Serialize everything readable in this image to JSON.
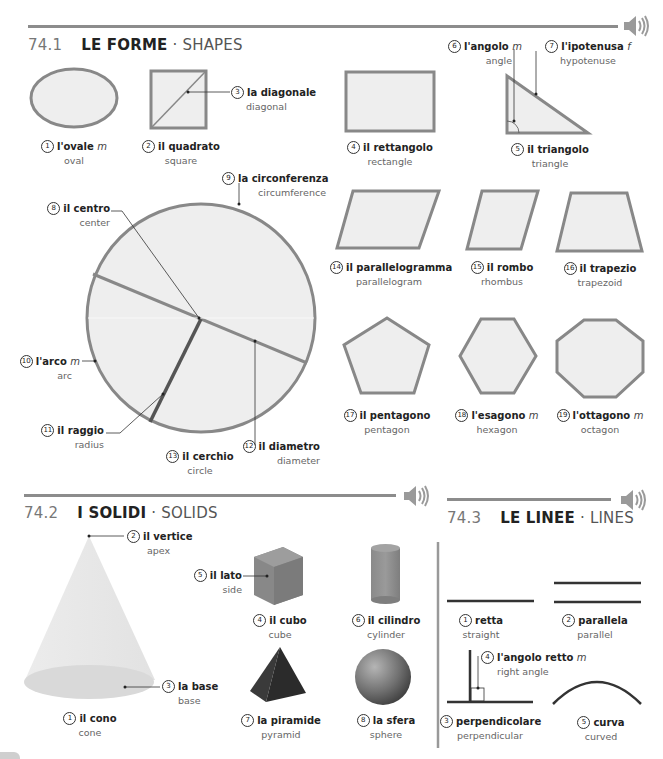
{
  "colors": {
    "shape_fill": "#eeeeee",
    "shape_stroke": "#888888",
    "rule": "#8c8c8c",
    "solid_fill": "#8a8a8a",
    "text_dark": "#222222",
    "text_light": "#666666"
  },
  "sections": {
    "shapes": {
      "number": "74.1",
      "title_it": "LE FORME",
      "separator": "·",
      "title_en": "SHAPES",
      "speaker_icon": "speaker-icon",
      "items": [
        {
          "n": "1",
          "it": "l'ovale",
          "gender": "m",
          "en": "oval"
        },
        {
          "n": "2",
          "it": "il quadrato",
          "gender": "",
          "en": "square"
        },
        {
          "n": "3",
          "it": "la diagonale",
          "gender": "",
          "en": "diagonal"
        },
        {
          "n": "4",
          "it": "il rettangolo",
          "gender": "",
          "en": "rectangle"
        },
        {
          "n": "5",
          "it": "il triangolo",
          "gender": "",
          "en": "triangle"
        },
        {
          "n": "6",
          "it": "l'angolo",
          "gender": "m",
          "en": "angle"
        },
        {
          "n": "7",
          "it": "l'ipotenusa",
          "gender": "f",
          "en": "hypotenuse"
        },
        {
          "n": "8",
          "it": "il centro",
          "gender": "",
          "en": "center"
        },
        {
          "n": "9",
          "it": "la circonferenza",
          "gender": "",
          "en": "circumference"
        },
        {
          "n": "10",
          "it": "l'arco",
          "gender": "m",
          "en": "arc"
        },
        {
          "n": "11",
          "it": "il raggio",
          "gender": "",
          "en": "radius"
        },
        {
          "n": "12",
          "it": "il diametro",
          "gender": "",
          "en": "diameter"
        },
        {
          "n": "13",
          "it": "il cerchio",
          "gender": "",
          "en": "circle"
        },
        {
          "n": "14",
          "it": "il parallelogramma",
          "gender": "",
          "en": "parallelogram"
        },
        {
          "n": "15",
          "it": "il rombo",
          "gender": "",
          "en": "rhombus"
        },
        {
          "n": "16",
          "it": "il trapezio",
          "gender": "",
          "en": "trapezoid"
        },
        {
          "n": "17",
          "it": "il pentagono",
          "gender": "",
          "en": "pentagon"
        },
        {
          "n": "18",
          "it": "l'esagono",
          "gender": "m",
          "en": "hexagon"
        },
        {
          "n": "19",
          "it": "l'ottagono",
          "gender": "m",
          "en": "octagon"
        }
      ]
    },
    "solids": {
      "number": "74.2",
      "title_it": "I SOLIDI",
      "separator": "·",
      "title_en": "SOLIDS",
      "speaker_icon": "speaker-icon",
      "items": [
        {
          "n": "1",
          "it": "il cono",
          "gender": "",
          "en": "cone"
        },
        {
          "n": "2",
          "it": "il vertice",
          "gender": "",
          "en": "apex"
        },
        {
          "n": "3",
          "it": "la base",
          "gender": "",
          "en": "base"
        },
        {
          "n": "4",
          "it": "il cubo",
          "gender": "",
          "en": "cube"
        },
        {
          "n": "5",
          "it": "il lato",
          "gender": "",
          "en": "side"
        },
        {
          "n": "6",
          "it": "il cilindro",
          "gender": "",
          "en": "cylinder"
        },
        {
          "n": "7",
          "it": "la piramide",
          "gender": "",
          "en": "pyramid"
        },
        {
          "n": "8",
          "it": "la sfera",
          "gender": "",
          "en": "sphere"
        }
      ]
    },
    "lines": {
      "number": "74.3",
      "title_it": "LE LINEE",
      "separator": "·",
      "title_en": "LINES",
      "speaker_icon": "speaker-icon",
      "items": [
        {
          "n": "1",
          "it": "retta",
          "gender": "",
          "en": "straight"
        },
        {
          "n": "2",
          "it": "parallela",
          "gender": "",
          "en": "parallel"
        },
        {
          "n": "3",
          "it": "perpendicolare",
          "gender": "",
          "en": "perpendicular"
        },
        {
          "n": "4",
          "it": "l'angolo retto",
          "gender": "m",
          "en": "right angle"
        },
        {
          "n": "5",
          "it": "curva",
          "gender": "",
          "en": "curved"
        }
      ]
    }
  }
}
